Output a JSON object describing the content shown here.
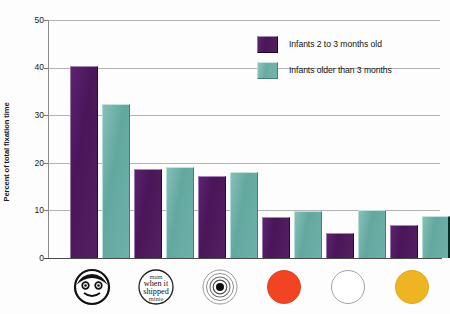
{
  "chart_data": {
    "type": "bar",
    "title": "",
    "xlabel": "",
    "ylabel": "Percent of total fixation time",
    "ylim": [
      0,
      50
    ],
    "yticks": [
      0,
      10,
      20,
      30,
      40,
      50
    ],
    "grid": true,
    "legend_position": "top-right",
    "categories": [
      "schematic face",
      "scrambled text",
      "concentric circles (bullseye)",
      "red disk",
      "white disk",
      "yellow disk"
    ],
    "series": [
      {
        "name": "Infants 2 to 3 months old",
        "color": "#4a1659",
        "values": [
          40.3,
          18.6,
          17.2,
          8.7,
          5.2,
          7.0
        ]
      },
      {
        "name": "Infants older than 3 months",
        "color": "#6aaca3",
        "values": [
          32.3,
          19.2,
          18.0,
          9.9,
          10.0,
          8.9
        ]
      }
    ]
  },
  "axes": {
    "y_title": "Percent of total fixation time",
    "y_tick_labels": [
      "50",
      "40",
      "30",
      "20",
      "10",
      "0"
    ]
  },
  "legend": {
    "items": [
      {
        "label": "Infants 2 to 3 months old",
        "swatch": "purple"
      },
      {
        "label": "Infants older than 3 months",
        "swatch": "teal"
      }
    ]
  },
  "x_icons": [
    {
      "name": "schematic-face-icon",
      "text": ""
    },
    {
      "name": "scrambled-text-icon",
      "text_lines": [
        "when it",
        "shipped"
      ]
    },
    {
      "name": "bullseye-icon",
      "text": ""
    },
    {
      "name": "red-disk-icon",
      "color": "#f24423"
    },
    {
      "name": "white-disk-icon",
      "color": "#ffffff"
    },
    {
      "name": "yellow-disk-icon",
      "color": "#eeb422"
    }
  ]
}
